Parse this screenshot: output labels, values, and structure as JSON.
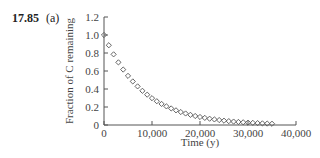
{
  "problem": {
    "number": "17.85",
    "part": "(a)"
  },
  "chart_data": {
    "type": "scatter",
    "title": "",
    "xlabel": "Time (y)",
    "ylabel": "Fraction of C remaining",
    "xlim": [
      0,
      40000
    ],
    "ylim": [
      0,
      1.2
    ],
    "x_ticks": [
      0,
      10000,
      20000,
      30000,
      40000
    ],
    "x_tick_labels": [
      "0",
      "10,000",
      "20,000",
      "30,000",
      "40,000"
    ],
    "y_ticks": [
      0,
      0.2,
      0.4,
      0.6,
      0.8,
      1.0,
      1.2
    ],
    "y_tick_labels": [
      "0",
      "0.2",
      "0.4",
      "0.6",
      "0.8",
      "1.0",
      "1.2"
    ],
    "grid": false,
    "legend": null,
    "marker": "open-diamond",
    "series": [
      {
        "name": "Fraction remaining",
        "x": [
          0,
          1000,
          2000,
          3000,
          4000,
          5000,
          6000,
          7000,
          8000,
          9000,
          10000,
          11000,
          12000,
          13000,
          14000,
          15000,
          16000,
          17000,
          18000,
          19000,
          20000,
          21000,
          22000,
          23000,
          24000,
          25000,
          26000,
          27000,
          28000,
          29000,
          30000,
          31000,
          32000,
          33000,
          34000,
          35000
        ],
        "values": [
          1.0,
          0.886,
          0.785,
          0.696,
          0.616,
          0.546,
          0.484,
          0.429,
          0.38,
          0.337,
          0.298,
          0.264,
          0.234,
          0.207,
          0.184,
          0.163,
          0.144,
          0.128,
          0.113,
          0.1,
          0.089,
          0.079,
          0.07,
          0.062,
          0.055,
          0.048,
          0.043,
          0.038,
          0.034,
          0.03,
          0.026,
          0.024,
          0.021,
          0.018,
          0.016,
          0.014
        ]
      }
    ]
  },
  "colors": {
    "axis": "#555555",
    "marker": "#555555",
    "text": "#333333"
  }
}
